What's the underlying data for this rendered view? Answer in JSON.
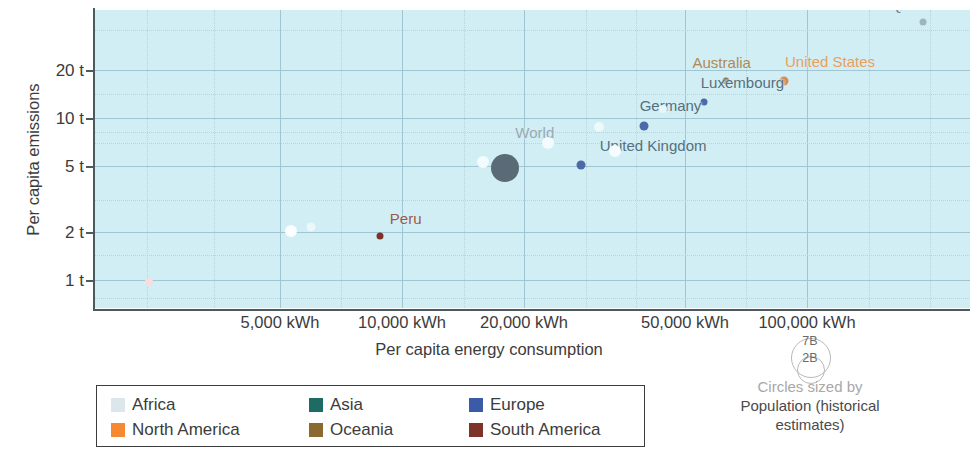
{
  "chart_data": {
    "type": "scatter",
    "title": "",
    "xlabel": "Per capita energy consumption",
    "ylabel": "Per capita emissions",
    "xscale": "log",
    "yscale": "log",
    "xlim": [
      3000,
      200000
    ],
    "ylim": [
      0.7,
      40
    ],
    "grid": true,
    "xticks": [
      {
        "value": 5000,
        "label": "5,000 kWh"
      },
      {
        "value": 10000,
        "label": "10,000 kWh"
      },
      {
        "value": 20000,
        "label": "20,000 kWh"
      },
      {
        "value": 50000,
        "label": "50,000 kWh"
      },
      {
        "value": 100000,
        "label": "100,000 kWh"
      }
    ],
    "yticks": [
      {
        "value": 1,
        "label": "1 t"
      },
      {
        "value": 2,
        "label": "2 t"
      },
      {
        "value": 5,
        "label": "5 t"
      },
      {
        "value": 10,
        "label": "10 t"
      },
      {
        "value": 20,
        "label": "20 t"
      }
    ],
    "size_encoding": "Population (historical estimates)",
    "points": [
      {
        "name": "Qatar",
        "x": 160000,
        "y": 34,
        "continent": "Asia",
        "color": "#9fb6bd",
        "r": 3.5,
        "label_dx": -14,
        "label_dy": -5,
        "label_color": "#6b7f86",
        "labeled": true
      },
      {
        "name": "United States",
        "x": 82000,
        "y": 15.2,
        "continent": "North America",
        "color": "#d98c52",
        "r": 4.5,
        "label_dx": 46,
        "label_dy": -7,
        "label_color": "#e8a05c",
        "labeled": true
      },
      {
        "name": "Australia",
        "x": 62000,
        "y": 15.2,
        "continent": "Oceania",
        "color": "#8a6a4a",
        "r": 3.5,
        "label_dx": -4,
        "label_dy": -7,
        "label_color": "#b08a52",
        "labeled": true
      },
      {
        "name": "Luxembourg",
        "x": 56000,
        "y": 11.5,
        "continent": "Europe",
        "color": "#4a6aa8",
        "r": 3.5,
        "label_dx": 38,
        "label_dy": -7,
        "label_color": "#56707c",
        "labeled": true
      },
      {
        "name": "Germany",
        "x": 42000,
        "y": 8.3,
        "continent": "Europe",
        "color": "#4a6aa8",
        "r": 4.5,
        "label_dx": 26,
        "label_dy": -7,
        "label_color": "#56707c",
        "labeled": true
      },
      {
        "name": "United Kingdom",
        "x": 31000,
        "y": 4.9,
        "continent": "Europe",
        "color": "#4a6aa8",
        "r": 4.5,
        "label_dx": 72,
        "label_dy": -6,
        "label_color": "#56707c",
        "labeled": true
      },
      {
        "name": "World",
        "x": 21500,
        "y": 4.7,
        "continent": "World",
        "color": "#5a6a76",
        "r": 14,
        "label_dx": 30,
        "label_dy": -13,
        "label_color": "#9aa9b0",
        "labeled": true
      },
      {
        "name": "Peru",
        "x": 11800,
        "y": 1.85,
        "continent": "South America",
        "color": "#7d3328",
        "r": 3.5,
        "label_dx": 26,
        "label_dy": -6,
        "label_color": "#9a5a45",
        "labeled": true
      },
      {
        "name": "",
        "x": 19400,
        "y": 5.1,
        "continent": "Africa",
        "color": "#f2fbfd",
        "r": 6,
        "labeled": false
      },
      {
        "name": "",
        "x": 26500,
        "y": 6.6,
        "continent": "Africa",
        "color": "#f2fbfd",
        "r": 6,
        "labeled": false
      },
      {
        "name": "",
        "x": 33800,
        "y": 8.2,
        "continent": "Africa",
        "color": "#eef9fc",
        "r": 5,
        "labeled": false
      },
      {
        "name": "",
        "x": 36500,
        "y": 5.9,
        "continent": "Africa",
        "color": "#f4fcfd",
        "r": 6,
        "labeled": false
      },
      {
        "name": "",
        "x": 46000,
        "y": 10.4,
        "continent": "Africa",
        "color": "#e6f6fa",
        "r": 4,
        "labeled": false
      },
      {
        "name": "",
        "x": 7700,
        "y": 2.0,
        "continent": "Africa",
        "color": "#fbfeff",
        "r": 6,
        "labeled": false
      },
      {
        "name": "",
        "x": 8500,
        "y": 2.1,
        "continent": "Africa",
        "color": "#eaf8fb",
        "r": 4.5,
        "labeled": false
      },
      {
        "name": "",
        "x": 3900,
        "y": 1.0,
        "continent": "Africa",
        "color": "#f6dede",
        "r": 4,
        "labeled": false
      }
    ],
    "legend": {
      "position": "bottom-left",
      "entries": [
        {
          "label": "Africa",
          "color": "#dbe7ea"
        },
        {
          "label": "Asia",
          "color": "#1d6b63"
        },
        {
          "label": "Europe",
          "color": "#3b5ba8"
        },
        {
          "label": "North America",
          "color": "#f58a33"
        },
        {
          "label": "Oceania",
          "color": "#8a6a2f"
        },
        {
          "label": "South America",
          "color": "#7d3328"
        }
      ]
    },
    "size_legend": {
      "big_label": "7B",
      "small_label": "2B",
      "caption_line1": "Circles sized by",
      "caption_line2": "Population (historical",
      "caption_line3": "estimates)"
    }
  }
}
